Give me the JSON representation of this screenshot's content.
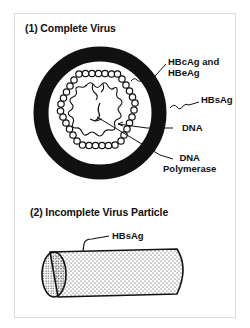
{
  "figure": {
    "section1": {
      "title": "(1) Complete Virus",
      "labels": {
        "core_antigen_line1": "HBcAg and",
        "core_antigen_line2": "HBeAg",
        "surface_antigen": "HBsAg",
        "dna": "DNA",
        "polymerase_line1": "DNA",
        "polymerase_line2": "Polymerase"
      }
    },
    "section2": {
      "title": "(2) Incomplete Virus Particle",
      "labels": {
        "surface_antigen": "HBsAg"
      }
    },
    "colors": {
      "ink": "#111111",
      "frame_border": "#dcdcdc",
      "background": "#ffffff"
    }
  }
}
